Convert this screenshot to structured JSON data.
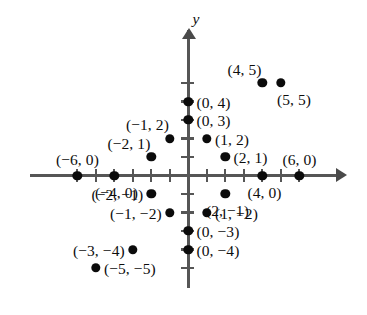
{
  "figure": {
    "type": "coordinate-plane-scatter",
    "axis_labels": {
      "y": "y"
    },
    "colors": {
      "axis": "#565656",
      "point": "#0b0b0b",
      "text": "#0d0d0d",
      "background": "#ffffff"
    },
    "origin_px": {
      "x": 188.4,
      "y": 175.5
    },
    "unit_px": 18.5,
    "x_axis": {
      "tick_values": [
        -6,
        -5,
        -4,
        -3,
        -2,
        -1,
        1,
        2,
        3,
        4,
        5,
        6
      ],
      "arrow": "right"
    },
    "y_axis": {
      "tick_values": [
        5,
        4,
        3,
        2,
        1,
        -1,
        -2,
        -3,
        -4,
        -5
      ],
      "arrow": "up"
    }
  },
  "chart_data": {
    "type": "scatter",
    "title": "",
    "xlabel": "",
    "ylabel": "y",
    "xlim": [
      -7,
      7
    ],
    "ylim": [
      -5.8,
      6.2
    ],
    "grid": false,
    "legend": "none",
    "points": [
      {
        "label": "(4, 5)",
        "x": 4,
        "y": 5,
        "label_pos": "above-left"
      },
      {
        "label": "(5, 5)",
        "x": 5,
        "y": 5,
        "label_pos": "below-right"
      },
      {
        "label": "(0, 4)",
        "x": 0,
        "y": 4,
        "label_pos": "right"
      },
      {
        "label": "(0, 3)",
        "x": 0,
        "y": 3,
        "label_pos": "right"
      },
      {
        "label": "(−1, 2)",
        "x": -1,
        "y": 2,
        "label_pos": "above-left"
      },
      {
        "label": "(1, 2)",
        "x": 1,
        "y": 2,
        "label_pos": "right"
      },
      {
        "label": "(−2, 1)",
        "x": -2,
        "y": 1,
        "label_pos": "above-left"
      },
      {
        "label": "(2, 1)",
        "x": 2,
        "y": 1,
        "label_pos": "right"
      },
      {
        "label": "(−6, 0)",
        "x": -6,
        "y": 0,
        "label_pos": "above"
      },
      {
        "label": "(6, 0)",
        "x": 6,
        "y": 0,
        "label_pos": "above"
      },
      {
        "label": "(−4, 0)",
        "x": -4,
        "y": 0,
        "label_pos": "below"
      },
      {
        "label": "(4, 0)",
        "x": 4,
        "y": 0,
        "label_pos": "below"
      },
      {
        "label": "(−2, −1)",
        "x": -2,
        "y": -1,
        "label_pos": "left"
      },
      {
        "label": "(2, −1)",
        "x": 2,
        "y": -1,
        "label_pos": "below"
      },
      {
        "label": "(−1, −2)",
        "x": -1,
        "y": -2,
        "label_pos": "left"
      },
      {
        "label": "(1, −2)",
        "x": 1,
        "y": -2,
        "label_pos": "right"
      },
      {
        "label": "(0, −3)",
        "x": 0,
        "y": -3,
        "label_pos": "right"
      },
      {
        "label": "(0, −4)",
        "x": 0,
        "y": -4,
        "label_pos": "right"
      },
      {
        "label": "(−3, −4)",
        "x": -3,
        "y": -4,
        "label_pos": "left"
      },
      {
        "label": "(−5, −5)",
        "x": -5,
        "y": -5,
        "label_pos": "right"
      }
    ]
  }
}
